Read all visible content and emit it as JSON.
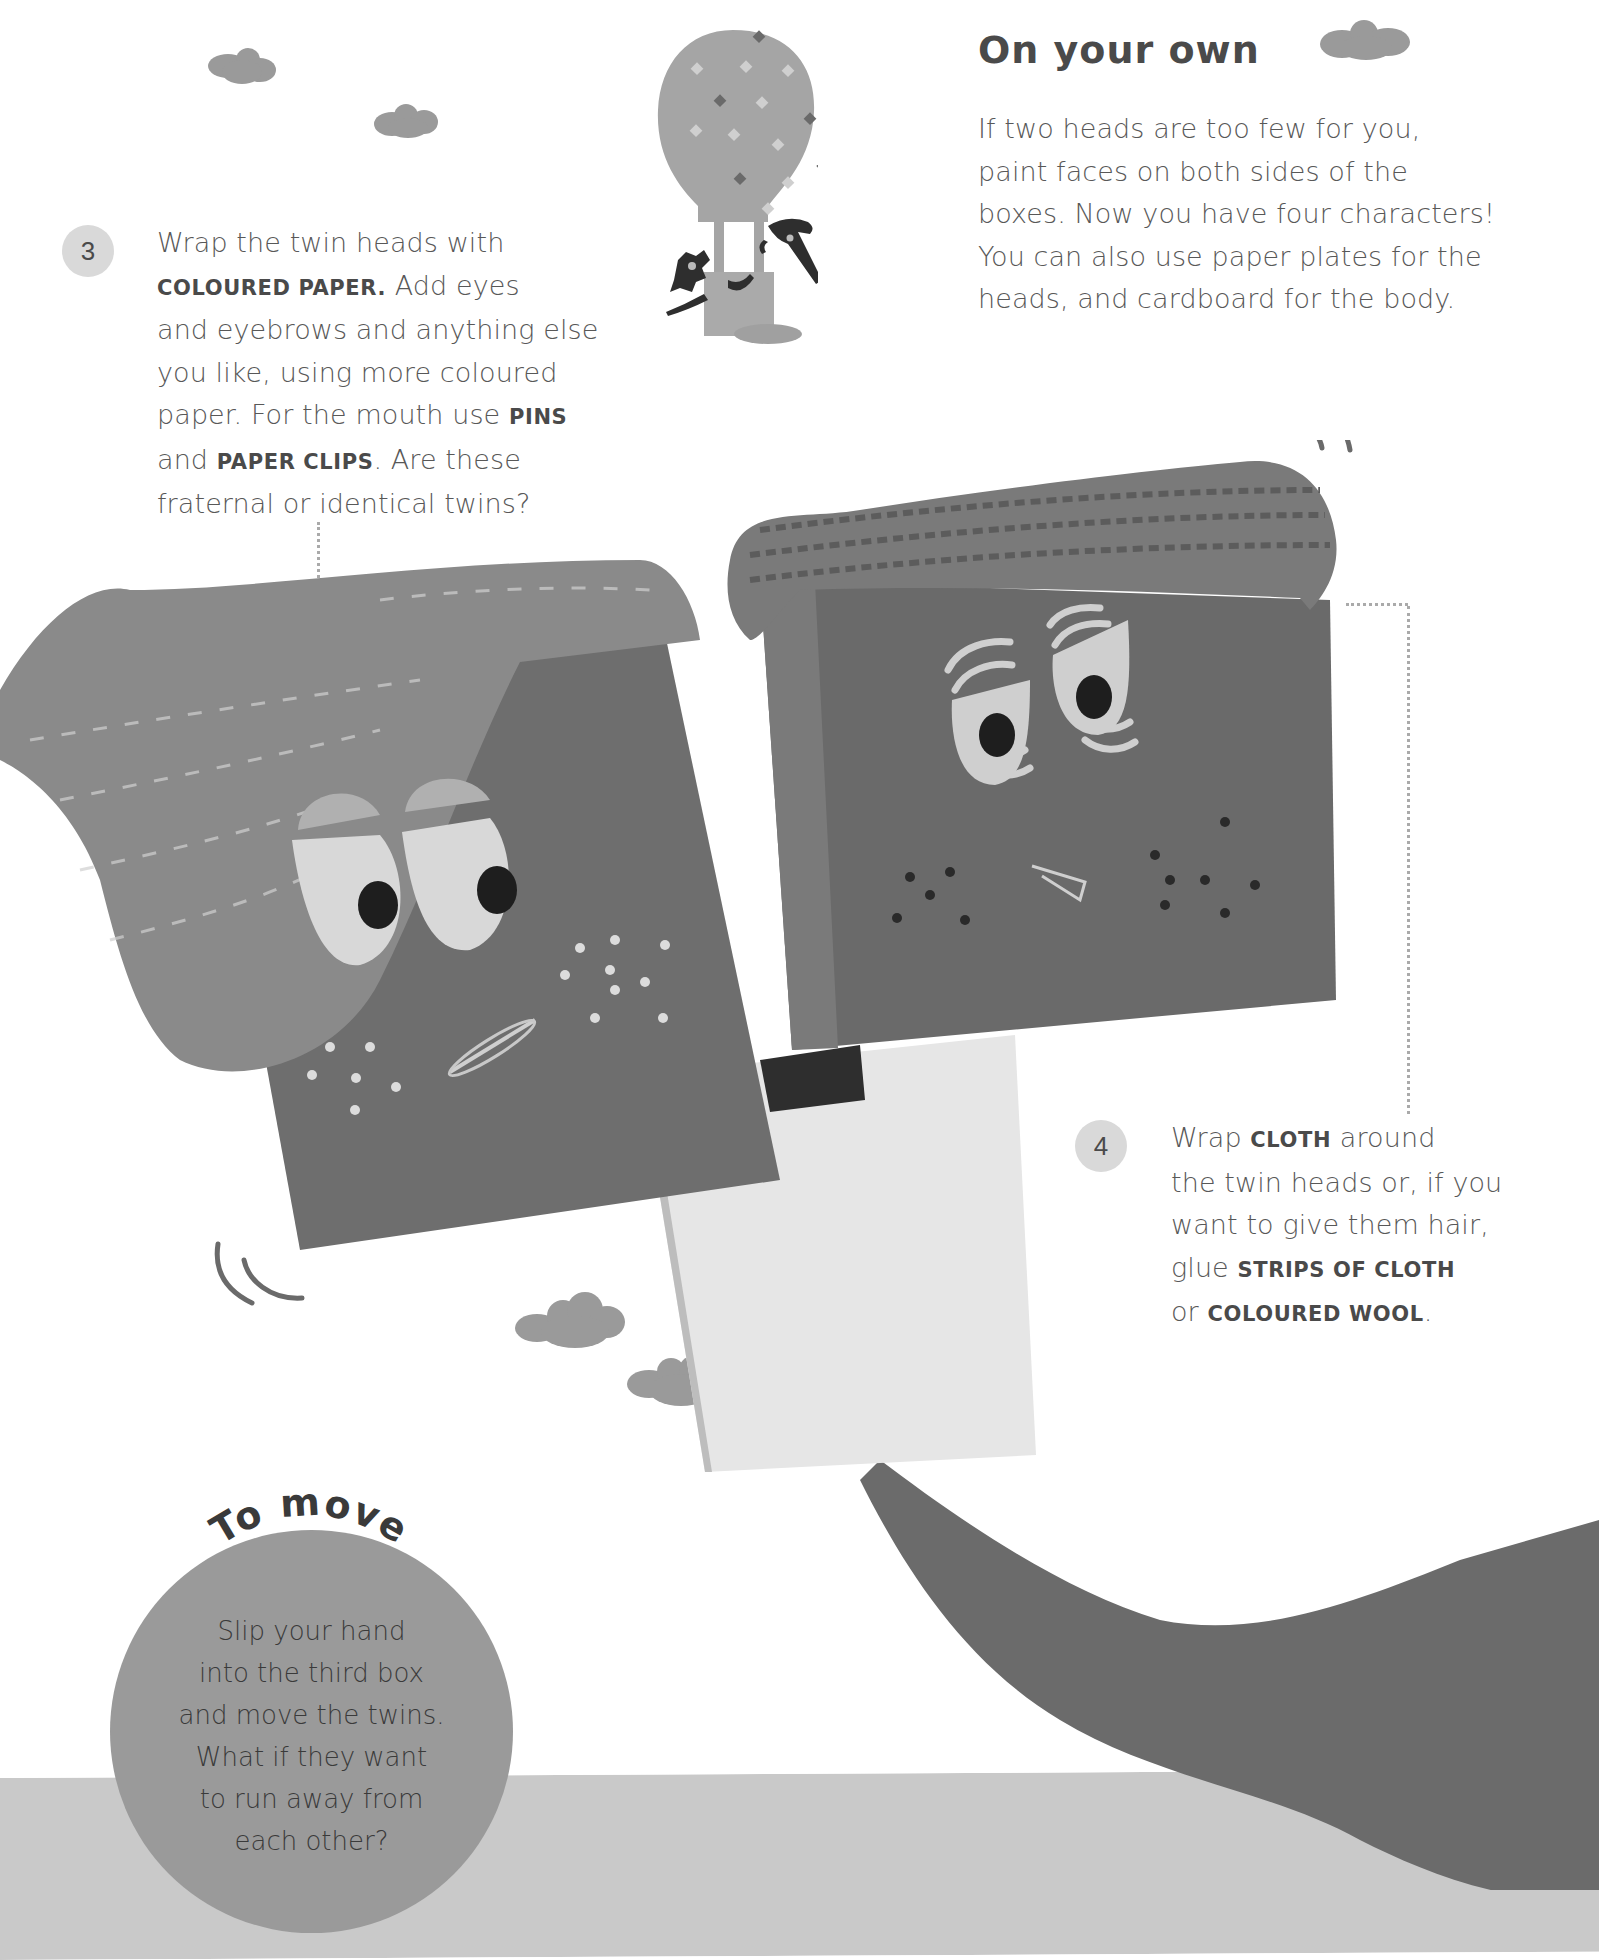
{
  "on_your_own": {
    "heading": "On your own",
    "lines": [
      "If two heads are too few for you,",
      "paint faces on both sides of the",
      "boxes. Now you have four characters!",
      "You can also use paper plates for the",
      "heads, and cardboard for the body."
    ]
  },
  "step3": {
    "number": "3",
    "line1": "Wrap the twin heads with",
    "line2_bold": "COLOURED PAPER.",
    "line2_rest": " Add eyes",
    "line3": "and eyebrows and anything else",
    "line4": "you like, using more coloured",
    "line5_pre": "paper. For the mouth use ",
    "line5_bold": "PINS",
    "line6_pre": "and ",
    "line6_bold": "PAPER CLIPS",
    "line6_rest": ". Are these",
    "line7": "fraternal or identical twins?"
  },
  "step4": {
    "number": "4",
    "line1_pre": "Wrap ",
    "line1_bold": "CLOTH",
    "line1_rest": " around",
    "line2": "the twin heads or, if you",
    "line3": "want to give them hair,",
    "line4_pre": "glue ",
    "line4_bold": "STRIPS OF CLOTH",
    "line5_pre": "or ",
    "line5_bold": "COLOURED WOOL",
    "line5_rest": "."
  },
  "to_move": {
    "heading": "To move",
    "lines": [
      "Slip your hand",
      "into the third box",
      "and move the twins.",
      "What if they want",
      "to run away from",
      "each other?"
    ]
  },
  "colors": {
    "cloud": "#9a9a9a",
    "box_left": "#6e6e6e",
    "box_right": "#6a6a6a",
    "cloth_left": "#8a8a8a",
    "cloth_right": "#7a7a7a",
    "arm": "#6b6b6b",
    "floor": "#c9c9c9",
    "badge": "#d9d9d9"
  }
}
